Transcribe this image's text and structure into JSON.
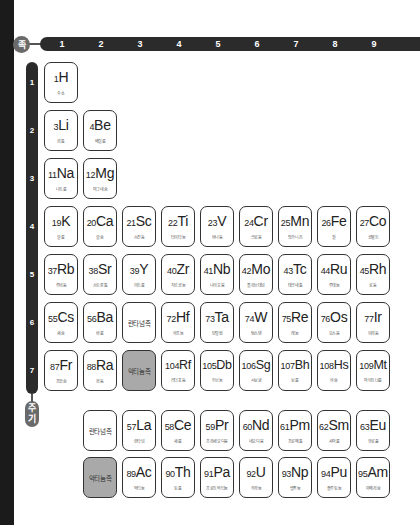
{
  "axis": {
    "group_label": "족",
    "period_label_top": "주",
    "period_label_bottom": "기",
    "groups": [
      "1",
      "2",
      "3",
      "4",
      "5",
      "6",
      "7",
      "8",
      "9"
    ],
    "periods": [
      "1",
      "2",
      "3",
      "4",
      "5",
      "6",
      "7"
    ]
  },
  "colors": {
    "bar": "#2b2b2b",
    "label_circle": "#6a6a6a",
    "actinide_highlight": "#a9a9a9"
  },
  "elements": [
    {
      "num": "1",
      "sym": "H",
      "name": "수소",
      "row": 0,
      "col": 0
    },
    {
      "num": "3",
      "sym": "Li",
      "name": "리튬",
      "row": 1,
      "col": 0
    },
    {
      "num": "4",
      "sym": "Be",
      "name": "베릴륨",
      "row": 1,
      "col": 1
    },
    {
      "num": "11",
      "sym": "Na",
      "name": "나트륨",
      "row": 2,
      "col": 0
    },
    {
      "num": "12",
      "sym": "Mg",
      "name": "마그네슘",
      "row": 2,
      "col": 1
    },
    {
      "num": "19",
      "sym": "K",
      "name": "칼륨",
      "row": 3,
      "col": 0
    },
    {
      "num": "20",
      "sym": "Ca",
      "name": "칼슘",
      "row": 3,
      "col": 1
    },
    {
      "num": "21",
      "sym": "Sc",
      "name": "스칸듐",
      "row": 3,
      "col": 2
    },
    {
      "num": "22",
      "sym": "Ti",
      "name": "타이타늄",
      "row": 3,
      "col": 3
    },
    {
      "num": "23",
      "sym": "V",
      "name": "바나듐",
      "row": 3,
      "col": 4
    },
    {
      "num": "24",
      "sym": "Cr",
      "name": "크로뮴",
      "row": 3,
      "col": 5
    },
    {
      "num": "25",
      "sym": "Mn",
      "name": "망가니즈",
      "row": 3,
      "col": 6
    },
    {
      "num": "26",
      "sym": "Fe",
      "name": "철",
      "row": 3,
      "col": 7
    },
    {
      "num": "27",
      "sym": "Co",
      "name": "코발트",
      "row": 3,
      "col": 8
    },
    {
      "num": "37",
      "sym": "Rb",
      "name": "루비듐",
      "row": 4,
      "col": 0
    },
    {
      "num": "38",
      "sym": "Sr",
      "name": "스트론튬",
      "row": 4,
      "col": 1
    },
    {
      "num": "39",
      "sym": "Y",
      "name": "이트륨",
      "row": 4,
      "col": 2
    },
    {
      "num": "40",
      "sym": "Zr",
      "name": "지르코늄",
      "row": 4,
      "col": 3
    },
    {
      "num": "41",
      "sym": "Nb",
      "name": "나이오븀",
      "row": 4,
      "col": 4
    },
    {
      "num": "42",
      "sym": "Mo",
      "name": "몰리브데넘",
      "row": 4,
      "col": 5
    },
    {
      "num": "43",
      "sym": "Tc",
      "name": "테크네튬",
      "row": 4,
      "col": 6
    },
    {
      "num": "44",
      "sym": "Ru",
      "name": "루테늄",
      "row": 4,
      "col": 7
    },
    {
      "num": "45",
      "sym": "Rh",
      "name": "로듐",
      "row": 4,
      "col": 8
    },
    {
      "num": "55",
      "sym": "Cs",
      "name": "세슘",
      "row": 5,
      "col": 0
    },
    {
      "num": "56",
      "sym": "Ba",
      "name": "바륨",
      "row": 5,
      "col": 1
    },
    {
      "num": "72",
      "sym": "Hf",
      "name": "하프늄",
      "row": 5,
      "col": 3
    },
    {
      "num": "73",
      "sym": "Ta",
      "name": "탄탈럼",
      "row": 5,
      "col": 4
    },
    {
      "num": "74",
      "sym": "W",
      "name": "텅스텐",
      "row": 5,
      "col": 5
    },
    {
      "num": "75",
      "sym": "Re",
      "name": "레늄",
      "row": 5,
      "col": 6
    },
    {
      "num": "76",
      "sym": "Os",
      "name": "오스뮴",
      "row": 5,
      "col": 7
    },
    {
      "num": "77",
      "sym": "Ir",
      "name": "이리듐",
      "row": 5,
      "col": 8
    },
    {
      "num": "87",
      "sym": "Fr",
      "name": "프랑슘",
      "row": 6,
      "col": 0
    },
    {
      "num": "88",
      "sym": "Ra",
      "name": "라듐",
      "row": 6,
      "col": 1
    },
    {
      "num": "104",
      "sym": "Rf",
      "name": "러더포듐",
      "row": 6,
      "col": 3
    },
    {
      "num": "105",
      "sym": "Db",
      "name": "두브늄",
      "row": 6,
      "col": 4
    },
    {
      "num": "106",
      "sym": "Sg",
      "name": "시보귬",
      "row": 6,
      "col": 5
    },
    {
      "num": "107",
      "sym": "Bh",
      "name": "보륨",
      "row": 6,
      "col": 6
    },
    {
      "num": "108",
      "sym": "Hs",
      "name": "하슘",
      "row": 6,
      "col": 7
    },
    {
      "num": "109",
      "sym": "Mt",
      "name": "마이트너륨",
      "row": 6,
      "col": 8
    },
    {
      "num": "57",
      "sym": "La",
      "name": "란타넘",
      "row": 8,
      "col": 2
    },
    {
      "num": "58",
      "sym": "Ce",
      "name": "세륨",
      "row": 8,
      "col": 3
    },
    {
      "num": "59",
      "sym": "Pr",
      "name": "프라세오디뮴",
      "row": 8,
      "col": 4
    },
    {
      "num": "60",
      "sym": "Nd",
      "name": "네오디뮴",
      "row": 8,
      "col": 5
    },
    {
      "num": "61",
      "sym": "Pm",
      "name": "프로메튬",
      "row": 8,
      "col": 6
    },
    {
      "num": "62",
      "sym": "Sm",
      "name": "사마륨",
      "row": 8,
      "col": 7
    },
    {
      "num": "63",
      "sym": "Eu",
      "name": "유로퓸",
      "row": 8,
      "col": 8
    },
    {
      "num": "89",
      "sym": "Ac",
      "name": "악티늄",
      "row": 9,
      "col": 2
    },
    {
      "num": "90",
      "sym": "Th",
      "name": "토륨",
      "row": 9,
      "col": 3
    },
    {
      "num": "91",
      "sym": "Pa",
      "name": "프로트악티늄",
      "row": 9,
      "col": 4
    },
    {
      "num": "92",
      "sym": "U",
      "name": "우라늄",
      "row": 9,
      "col": 5
    },
    {
      "num": "93",
      "sym": "Np",
      "name": "넵투늄",
      "row": 9,
      "col": 6
    },
    {
      "num": "94",
      "sym": "Pu",
      "name": "플루토늄",
      "row": 9,
      "col": 7
    },
    {
      "num": "95",
      "sym": "Am",
      "name": "아메리슘",
      "row": 9,
      "col": 8
    }
  ],
  "series": [
    {
      "label": "란타넘족",
      "row": 5,
      "col": 2,
      "highlight": false
    },
    {
      "label": "악티늄족",
      "row": 6,
      "col": 2,
      "highlight": true
    },
    {
      "label": "란타넘족",
      "row": 8,
      "col": 1,
      "highlight": false
    },
    {
      "label": "악티늄족",
      "row": 9,
      "col": 1,
      "highlight": true
    }
  ]
}
